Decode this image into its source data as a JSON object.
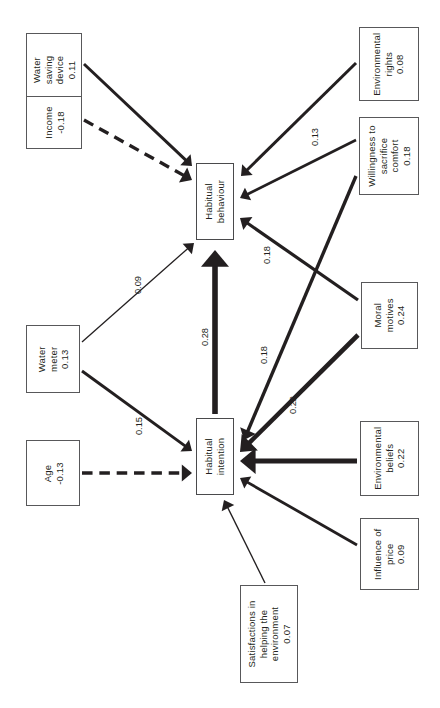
{
  "figure": {
    "type": "path-diagram",
    "orientation": "rotated-90-ccw",
    "caption": ""
  },
  "nodes": [
    {
      "id": "water-saving-device",
      "lines": [
        "Water",
        "saving",
        "device",
        "0.11"
      ],
      "label": "Water saving device",
      "value": "0.11",
      "role": "exogenous",
      "x": 26,
      "y": 33,
      "w": 56,
      "h": 73
    },
    {
      "id": "income",
      "lines": [
        "Income",
        "-0.18"
      ],
      "label": "Income",
      "value": "-0.18",
      "role": "exogenous",
      "x": 26,
      "y": 96,
      "w": 56,
      "h": 53
    },
    {
      "id": "water-meter",
      "lines": [
        "Water",
        "meter",
        "0.13"
      ],
      "label": "Water meter",
      "value": "0.13",
      "role": "exogenous",
      "x": 26,
      "y": 325,
      "w": 54,
      "h": 68
    },
    {
      "id": "age",
      "lines": [
        "Age",
        "-0.13"
      ],
      "label": "Age",
      "value": "-0.13",
      "role": "exogenous",
      "x": 26,
      "y": 440,
      "w": 54,
      "h": 66
    },
    {
      "id": "habitual-behaviour",
      "lines": [
        "Habitual",
        "behaviour"
      ],
      "label": "Habitual behaviour",
      "value": "",
      "role": "endogenous",
      "x": 196,
      "y": 163,
      "w": 38,
      "h": 77
    },
    {
      "id": "habitual-intention",
      "lines": [
        "Habitual",
        "intention"
      ],
      "label": "Habitual intention",
      "value": "",
      "role": "endogenous",
      "x": 196,
      "y": 418,
      "w": 38,
      "h": 77
    },
    {
      "id": "satisfactions",
      "lines": [
        "Satisfactions in",
        "helping the",
        "environment",
        "0.07"
      ],
      "label": "Satisfactions in helping the environment",
      "value": "0.07",
      "role": "exogenous",
      "x": 240,
      "y": 585,
      "w": 58,
      "h": 98
    },
    {
      "id": "environmental-rights",
      "lines": [
        "Environmental",
        "rights",
        "0.08"
      ],
      "label": "Environmental rights",
      "value": "0.08",
      "role": "exogenous",
      "x": 359,
      "y": 27,
      "w": 60,
      "h": 74
    },
    {
      "id": "willingness",
      "lines": [
        "Willingness to",
        "sacrifice",
        "comfort",
        "0.18"
      ],
      "label": "Willingness to sacrifice comfort",
      "value": "0.18",
      "role": "exogenous",
      "x": 359,
      "y": 117,
      "w": 60,
      "h": 78
    },
    {
      "id": "moral-motives",
      "lines": [
        "Moral",
        "motives",
        "0.24"
      ],
      "label": "Moral motives",
      "value": "0.24",
      "role": "exogenous",
      "x": 361,
      "y": 282,
      "w": 57,
      "h": 67
    },
    {
      "id": "environmental-beliefs",
      "lines": [
        "Environmental",
        "beliefs",
        "0.22"
      ],
      "label": "Environmental beliefs",
      "value": "0.22",
      "role": "exogenous",
      "x": 360,
      "y": 421,
      "w": 59,
      "h": 75
    },
    {
      "id": "influence-of-price",
      "lines": [
        "Influence of",
        "price",
        "0.09"
      ],
      "label": "Influence of price",
      "value": "0.09",
      "role": "exogenous",
      "x": 360,
      "y": 518,
      "w": 59,
      "h": 72
    }
  ],
  "edges": [
    {
      "id": "e-wsd-hb",
      "from": "water-saving-device",
      "to": "habitual-behaviour",
      "value": "",
      "style": "solid",
      "width": 3.0,
      "x1": 84,
      "y1": 64,
      "x2": 192,
      "y2": 166,
      "label_x": null,
      "label_y": null,
      "label_rot": -90
    },
    {
      "id": "e-inc-hb",
      "from": "income",
      "to": "habitual-behaviour",
      "value": "",
      "style": "dashed",
      "width": 3.4,
      "x1": 84,
      "y1": 120,
      "x2": 192,
      "y2": 180,
      "label_x": null,
      "label_y": null,
      "label_rot": -90
    },
    {
      "id": "e-wm-hb",
      "from": "water-meter",
      "to": "habitual-behaviour",
      "value": "0.09",
      "style": "solid",
      "width": 1.3,
      "x1": 82,
      "y1": 342,
      "x2": 194,
      "y2": 243,
      "label_x": 129,
      "label_y": 280,
      "label_rot": -90
    },
    {
      "id": "e-wm-hi",
      "from": "water-meter",
      "to": "habitual-intention",
      "value": "0.15",
      "style": "solid",
      "width": 2.9,
      "x1": 82,
      "y1": 371,
      "x2": 192,
      "y2": 451,
      "label_x": 130,
      "label_y": 421,
      "label_rot": -90
    },
    {
      "id": "e-age-hi",
      "from": "age",
      "to": "habitual-intention",
      "value": "",
      "style": "dashed",
      "width": 3.4,
      "x1": 82,
      "y1": 473,
      "x2": 192,
      "y2": 473,
      "label_x": null,
      "label_y": null,
      "label_rot": -90
    },
    {
      "id": "e-hi-hb",
      "from": "habitual-intention",
      "to": "habitual-behaviour",
      "value": "0.28",
      "style": "solid",
      "width": 5.6,
      "x1": 215,
      "y1": 414,
      "x2": 215,
      "y2": 250,
      "label_x": 196,
      "label_y": 332,
      "label_rot": -90
    },
    {
      "id": "e-er-hb",
      "from": "environmental-rights",
      "to": "habitual-behaviour",
      "value": "",
      "style": "solid",
      "width": 3.0,
      "x1": 356,
      "y1": 63,
      "x2": 241,
      "y2": 176,
      "label_x": null,
      "label_y": null,
      "label_rot": -90
    },
    {
      "id": "e-wil-hb",
      "from": "willingness",
      "to": "habitual-behaviour",
      "value": "0.13",
      "style": "solid",
      "width": 2.6,
      "x1": 356,
      "y1": 140,
      "x2": 240,
      "y2": 198,
      "label_x": 306,
      "label_y": 132,
      "label_rot": -90
    },
    {
      "id": "e-wil-hi",
      "from": "willingness",
      "to": "habitual-intention",
      "value": "0.18",
      "style": "solid",
      "width": 3.4,
      "x1": 356,
      "y1": 176,
      "x2": 244,
      "y2": 440,
      "label_x": 255,
      "label_y": 350,
      "label_rot": -90
    },
    {
      "id": "e-mm-hb",
      "from": "moral-motives",
      "to": "habitual-behaviour",
      "value": "0.18",
      "style": "solid",
      "width": 3.2,
      "x1": 358,
      "y1": 300,
      "x2": 240,
      "y2": 218,
      "label_x": 258,
      "label_y": 250,
      "label_rot": -90
    },
    {
      "id": "e-mm-hi",
      "from": "moral-motives",
      "to": "habitual-intention",
      "value": "0.22",
      "style": "solid",
      "width": 4.6,
      "x1": 358,
      "y1": 335,
      "x2": 240,
      "y2": 452,
      "label_x": 284,
      "label_y": 400,
      "label_rot": -90
    },
    {
      "id": "e-eb-hi",
      "from": "environmental-beliefs",
      "to": "habitual-intention",
      "value": "",
      "style": "solid",
      "width": 5.2,
      "x1": 357,
      "y1": 461,
      "x2": 240,
      "y2": 461,
      "label_x": null,
      "label_y": null,
      "label_rot": -90
    },
    {
      "id": "e-iop-hi",
      "from": "influence-of-price",
      "to": "habitual-intention",
      "value": "",
      "style": "solid",
      "width": 2.8,
      "x1": 357,
      "y1": 545,
      "x2": 240,
      "y2": 478,
      "label_x": null,
      "label_y": null,
      "label_rot": -90
    },
    {
      "id": "e-sat-hi",
      "from": "satisfactions",
      "to": "habitual-intention",
      "value": "",
      "style": "solid",
      "width": 1.4,
      "x1": 265,
      "y1": 583,
      "x2": 224,
      "y2": 500,
      "label_x": null,
      "label_y": null,
      "label_rot": -90
    }
  ],
  "colors": {
    "stroke": "#231f20",
    "node_border": "#58585a",
    "background": "#ffffff",
    "text": "#231f20"
  }
}
